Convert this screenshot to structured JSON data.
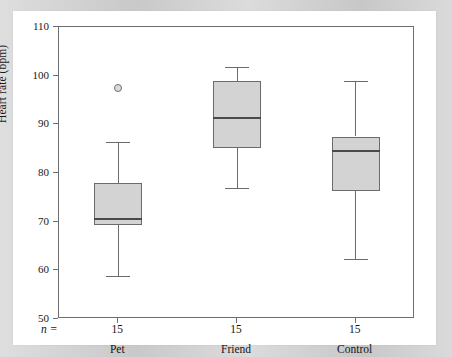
{
  "chart_data": {
    "type": "box",
    "title": "",
    "xlabel": "",
    "ylabel": "Heart rate (bpm)",
    "ylim": [
      50,
      110
    ],
    "yticks": [
      50,
      60,
      70,
      80,
      90,
      100,
      110
    ],
    "ytick_labels": [
      "50",
      "60",
      "70",
      "80",
      "90",
      "100",
      "110"
    ],
    "grid": false,
    "legend": "none",
    "n_row_label": "n =",
    "categories": [
      "Pet",
      "Friend",
      "Control"
    ],
    "counts": [
      "15",
      "15",
      "15"
    ],
    "boxes": [
      {
        "name": "Pet",
        "count": "15",
        "whisker_low": 58.8,
        "q1": 69.3,
        "median": 70.5,
        "q3": 78.0,
        "whisker_high": 86.4,
        "outliers": [
          97.4
        ]
      },
      {
        "name": "Friend",
        "count": "15",
        "whisker_low": 77.0,
        "q1": 85.2,
        "median": 91.3,
        "q3": 99.0,
        "whisker_high": 101.8,
        "outliers": []
      },
      {
        "name": "Control",
        "count": "15",
        "whisker_low": 62.3,
        "q1": 76.3,
        "median": 84.5,
        "q3": 87.5,
        "whisker_high": 99.0,
        "outliers": []
      }
    ],
    "colors": {
      "box_fill": "#d3d3d3",
      "box_stroke": "#6b6b6b",
      "median_stroke": "#4a4a4a",
      "axis": "#6e6e6e",
      "text": "#151515",
      "outlier_fill": "#dcdcdc",
      "page_background": "#ffffff",
      "mat_background": "#cdcdcd"
    }
  }
}
